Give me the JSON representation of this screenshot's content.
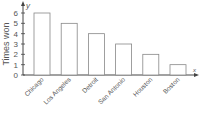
{
  "chart_data": {
    "type": "bar",
    "title": "",
    "xlabel": "x",
    "ylabel": "Times won",
    "y_axis_symbol": "y",
    "categories": [
      "Chicago",
      "Los Angeles",
      "Detroit",
      "San Antonio",
      "Houston",
      "Boston"
    ],
    "values": [
      6,
      5,
      4,
      3,
      2,
      1
    ],
    "ylim": [
      0,
      6
    ],
    "yticks": [
      0,
      1,
      2,
      3,
      4,
      5,
      6
    ],
    "grid": false,
    "legend": null,
    "bar_fill": "#ffffff",
    "bar_stroke": "#888888"
  }
}
